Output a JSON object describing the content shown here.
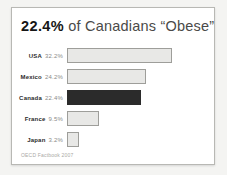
{
  "card": {
    "title_highlight": "22.4%",
    "title_rest": " of Canadians “Obese”",
    "source": "OECD Factbook 2007"
  },
  "chart_data": {
    "type": "bar",
    "orientation": "horizontal",
    "title": "22.4% of Canadians “Obese”",
    "categories": [
      "USA",
      "Mexico",
      "Canada",
      "France",
      "Japan"
    ],
    "values": [
      32.2,
      24.2,
      22.4,
      9.5,
      3.2
    ],
    "value_labels": [
      "32.2%",
      "24.2%",
      "22.4%",
      "9.5%",
      "3.2%"
    ],
    "highlight_category": "Canada",
    "highlight_index": 2,
    "xlabel": "",
    "ylabel": "",
    "xlim": [
      0,
      45
    ],
    "grid": false,
    "legend": false,
    "colors": {
      "bar_default": "#e8e8e6",
      "bar_border": "#9e9e9a",
      "bar_highlight": "#2b2b2b",
      "label_text": "#2b2b2b",
      "value_text": "#8a8a88"
    },
    "source_note": "OECD Factbook 2007"
  }
}
